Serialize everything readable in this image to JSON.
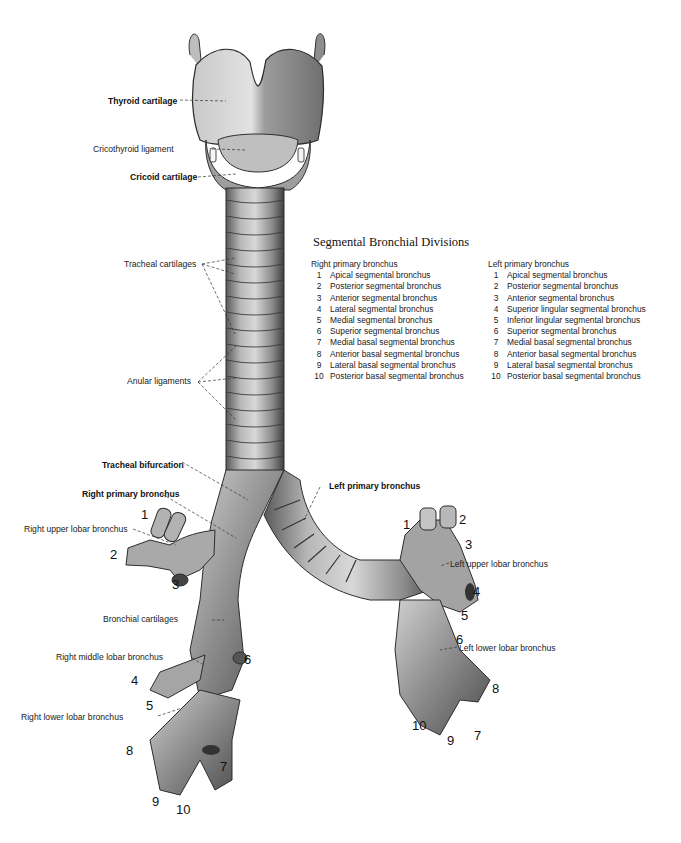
{
  "figure": {
    "background": "#ffffff",
    "structure_color": "#9a9a9a",
    "shadow_color": "#4a4a4a",
    "highlight_color": "#e6e6e6"
  },
  "legend": {
    "title": "Segmental Bronchial Divisions",
    "right": {
      "heading": "Right primary bronchus",
      "items": [
        {
          "n": "1",
          "label": "Apical segmental bronchus"
        },
        {
          "n": "2",
          "label": "Posterior segmental bronchus"
        },
        {
          "n": "3",
          "label": "Anterior segmental bronchus"
        },
        {
          "n": "4",
          "label": "Lateral segmental bronchus"
        },
        {
          "n": "5",
          "label": "Medial segmental bronchus"
        },
        {
          "n": "6",
          "label": "Superior segmental bronchus"
        },
        {
          "n": "7",
          "label": "Medial basal segmental bronchus"
        },
        {
          "n": "8",
          "label": "Anterior basal segmental bronchus"
        },
        {
          "n": "9",
          "label": "Lateral basal segmental bronchus"
        },
        {
          "n": "10",
          "label": "Posterior basal segmental bronchus"
        }
      ]
    },
    "left": {
      "heading": "Left primary bronchus",
      "items": [
        {
          "n": "1",
          "label": "Apical segmental bronchus"
        },
        {
          "n": "2",
          "label": "Posterior segmental bronchus"
        },
        {
          "n": "3",
          "label": "Anterior segmental bronchus"
        },
        {
          "n": "4",
          "label": "Superior lingular segmental bronchus"
        },
        {
          "n": "5",
          "label": "Inferior lingular segmental bronchus"
        },
        {
          "n": "6",
          "label": "Superior segmental bronchus"
        },
        {
          "n": "7",
          "label": "Medial basal segmental bronchus"
        },
        {
          "n": "8",
          "label": "Anterior basal segmental bronchus"
        },
        {
          "n": "9",
          "label": "Lateral basal segmental bronchus"
        },
        {
          "n": "10",
          "label": "Posterior basal segmental bronchus"
        }
      ]
    }
  },
  "labels": {
    "thyroid_cartilage": "Thyroid cartilage",
    "cricothyroid_ligament": "Cricothyroid ligament",
    "cricoid_cartilage": "Cricoid cartilage",
    "tracheal_cartilages": "Tracheal cartilages",
    "anular_ligaments": "Anular ligaments",
    "tracheal_bifurcation": "Tracheal bifurcation",
    "right_primary_bronchus": "Right primary bronchus",
    "right_upper_lobar_bronchus": "Right upper lobar bronchus",
    "bronchial_cartilages": "Bronchial cartilages",
    "right_middle_lobar_bronchus": "Right middle lobar bronchus",
    "right_lower_lobar_bronchus": "Right lower lobar bronchus",
    "left_primary_bronchus": "Left primary bronchus",
    "left_upper_lobar_bronchus": "Left upper lobar bronchus",
    "left_lower_lobar_bronchus": "Left lower lobar bronchus"
  },
  "segment_numbers": {
    "right": [
      "1",
      "2",
      "3",
      "4",
      "5",
      "6",
      "7",
      "8",
      "9",
      "10"
    ],
    "left": [
      "1",
      "2",
      "3",
      "4",
      "5",
      "6",
      "7",
      "8",
      "9",
      "10"
    ]
  }
}
